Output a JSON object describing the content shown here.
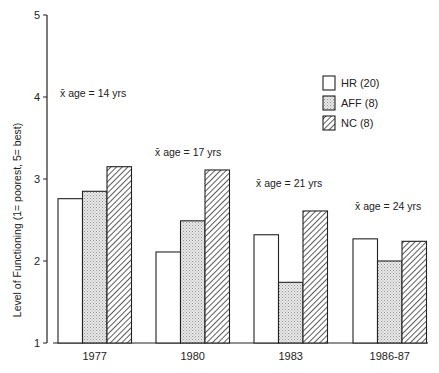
{
  "chart_data": {
    "type": "bar",
    "title": "",
    "xlabel": "",
    "ylabel": "Level of Functioning (1= poorest, 5= best)",
    "ylim": [
      1,
      5
    ],
    "yticks": [
      "1",
      "2",
      "3",
      "4",
      "5"
    ],
    "categories": [
      "1977",
      "1980",
      "1983",
      "1986-87"
    ],
    "series": [
      {
        "name": "HR (20)",
        "pattern": "white",
        "values": [
          2.76,
          2.11,
          2.32,
          2.27
        ]
      },
      {
        "name": "AFF (8)",
        "pattern": "stipple",
        "values": [
          2.85,
          2.49,
          1.74,
          2.0
        ]
      },
      {
        "name": "NC (8)",
        "pattern": "diagonal-hatch",
        "values": [
          3.15,
          3.11,
          2.61,
          2.24
        ]
      }
    ],
    "annotations": [
      {
        "text": "x̄ age = 14 yrs",
        "category": "1977"
      },
      {
        "text": "x̄ age = 17 yrs",
        "category": "1980"
      },
      {
        "text": "x̄ age = 21 yrs",
        "category": "1983"
      },
      {
        "text": "x̄ age = 24 yrs",
        "category": "1986-87"
      }
    ],
    "legend_position": "upper right",
    "grid": false
  }
}
